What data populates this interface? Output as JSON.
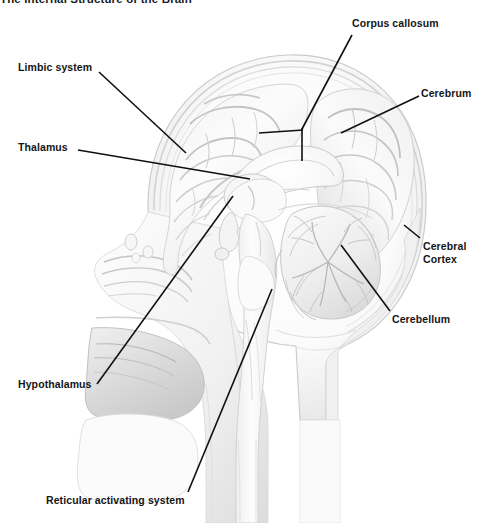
{
  "figure": {
    "title": "The Internal Structure of the Brain",
    "style": "grayscale pencil / airbrush medical illustration",
    "background_color": "#ffffff",
    "ink_color": "#151515",
    "leader_line_color": "#101010"
  },
  "labels": [
    {
      "id": "limbic-system",
      "text": "Limbic system",
      "side": "left",
      "lines": [
        "Limbic system"
      ],
      "text_x": 18,
      "text_y": 61,
      "leader": [
        [
          99,
          72
        ],
        [
          186,
          153
        ]
      ]
    },
    {
      "id": "thalamus",
      "text": "Thalamus",
      "side": "left",
      "lines": [
        "Thalamus"
      ],
      "text_x": 18,
      "text_y": 141,
      "leader": [
        [
          78,
          150
        ],
        [
          250,
          179
        ]
      ]
    },
    {
      "id": "hypothalamus",
      "text": "Hypothalamus",
      "side": "left",
      "lines": [
        "Hypothalamus"
      ],
      "text_x": 18,
      "text_y": 378,
      "leader": [
        [
          97,
          384
        ],
        [
          233,
          196
        ]
      ]
    },
    {
      "id": "reticular-activating-system",
      "text": "Reticular activating system",
      "side": "left",
      "lines": [
        "Reticular activating system"
      ],
      "text_x": 46,
      "text_y": 494,
      "leader": [
        [
          188,
          492
        ],
        [
          272,
          289
        ]
      ]
    },
    {
      "id": "corpus-callosum",
      "text": "Corpus callosum",
      "side": "right",
      "lines": [
        "Corpus callosum"
      ],
      "text_x": 352,
      "text_y": 17,
      "leader": [
        [
          352,
          35
        ],
        [
          301,
          128
        ]
      ],
      "leader_branch": [
        [
          302,
          131
        ],
        [
          259,
          133
        ]
      ],
      "leader_stem": [
        [
          302,
          128
        ],
        [
          302,
          161
        ]
      ]
    },
    {
      "id": "cerebrum",
      "text": "Cerebrum",
      "side": "right",
      "lines": [
        "Cerebrum"
      ],
      "text_x": 421,
      "text_y": 87,
      "leader": [
        [
          419,
          96
        ],
        [
          341,
          133
        ]
      ]
    },
    {
      "id": "cerebral-cortex",
      "text": "Cerebral\nCortex",
      "side": "right",
      "lines": [
        "Cerebral",
        "Cortex"
      ],
      "text_x": 423,
      "text_y": 240,
      "leader": [
        [
          420,
          238
        ],
        [
          404,
          225
        ]
      ]
    },
    {
      "id": "cerebellum",
      "text": "Cerebellum",
      "side": "right",
      "lines": [
        "Cerebellum"
      ],
      "text_x": 392,
      "text_y": 313,
      "leader": [
        [
          390,
          311
        ],
        [
          341,
          245
        ]
      ]
    }
  ],
  "anatomy_regions": [
    "cerebral hemisphere with gyri and sulci",
    "corpus callosum",
    "thalamus",
    "hypothalamus",
    "brainstem (midbrain, pons, medulla)",
    "cerebellum with arbor vitae",
    "spinal cord",
    "skull and scalp",
    "nasal cavity and sinuses",
    "tongue and oral cavity",
    "pharynx"
  ]
}
